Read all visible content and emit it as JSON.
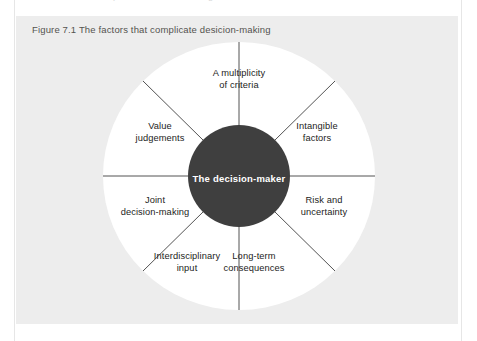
{
  "page": {
    "ghost_text_above": "complicate decision-making"
  },
  "figure": {
    "caption": "Figure 7.1 The factors that complicate desicion-making",
    "background_color": "#ededed",
    "disc_color": "#ffffff",
    "hub_color": "#3f3f3f",
    "spoke_color": "#3f3f3f",
    "text_color": "#1d1d1b"
  },
  "diagram": {
    "type": "radial-wheel",
    "hub_label": "The decision-maker",
    "sectors": [
      {
        "id": "multiplicity",
        "line1": "A multiplicity",
        "line2": "of criteria",
        "angle_deg": 90
      },
      {
        "id": "intangible",
        "line1": "Intangible",
        "line2": "factors",
        "angle_deg": 45
      },
      {
        "id": "risk",
        "line1": "Risk and",
        "line2": "uncertainty",
        "angle_deg": 0
      },
      {
        "id": "long-term",
        "line1": "Long-term",
        "line2": "consequences",
        "angle_deg": -45
      },
      {
        "id": "interdisciplinary",
        "line1": "Interdisciplinary",
        "line2": "input",
        "angle_deg": -135
      },
      {
        "id": "joint",
        "line1": "Joint",
        "line2": "decision-making",
        "angle_deg": 180
      },
      {
        "id": "value",
        "line1": "Value",
        "line2": "judgements",
        "angle_deg": 135
      }
    ],
    "spoke_count": 8
  }
}
